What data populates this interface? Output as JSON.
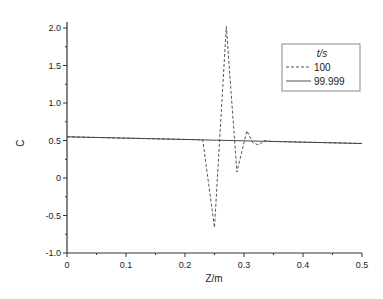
{
  "chart_data": {
    "type": "line",
    "title": "",
    "xlabel": "Z/m",
    "ylabel": "C",
    "xlim": [
      0,
      0.5
    ],
    "ylim": [
      -1.0,
      2.0
    ],
    "x_ticks": [
      "0",
      "0.1",
      "0.2",
      "0.3",
      "0.4",
      "0.5"
    ],
    "y_ticks": [
      "-1.0",
      "-0.5",
      "0",
      "0.5",
      "1.0",
      "1.5",
      "2.0"
    ],
    "grid": false,
    "legend": {
      "title": "t/s",
      "position": "upper right",
      "entries": [
        "100",
        "99.999"
      ]
    },
    "series": [
      {
        "name": "100",
        "style": "dashed",
        "x": [
          0,
          0.23,
          0.25,
          0.27,
          0.288,
          0.305,
          0.315,
          0.325,
          0.335,
          0.345,
          0.5
        ],
        "y": [
          0.55,
          0.51,
          -0.66,
          2.02,
          0.08,
          0.63,
          0.47,
          0.44,
          0.5,
          0.49,
          0.46
        ]
      },
      {
        "name": "99.999",
        "style": "solid",
        "x": [
          0,
          0.5
        ],
        "y": [
          0.55,
          0.46
        ]
      }
    ]
  }
}
